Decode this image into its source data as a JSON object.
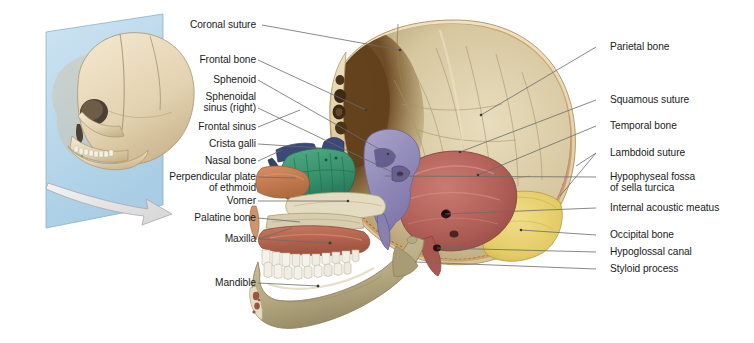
{
  "figure": {
    "background": "#ffffff"
  },
  "inset": {
    "name": "orientation-inset",
    "description": "Three-dimensional skull with sagittal cutting plane",
    "plane_color": "#bfdced",
    "bone_color": "#e8d9bd",
    "arrow_color": "#e2e2e2"
  },
  "labels_left": [
    {
      "id": "coronal-suture",
      "text": "Coronal suture",
      "text2": "",
      "x": 175,
      "y": 20,
      "lx": 262,
      "ly": 25,
      "tx": 400,
      "ty": 50
    },
    {
      "id": "frontal-bone",
      "text": "Frontal bone",
      "text2": "",
      "x": 186,
      "y": 55,
      "lx": 258,
      "ly": 60,
      "tx": 366,
      "ty": 110
    },
    {
      "id": "sphenoid",
      "text": "Sphenoid",
      "text2": "",
      "x": 205,
      "y": 75,
      "lx": 258,
      "ly": 80,
      "tx": 388,
      "ty": 154
    },
    {
      "id": "sphenoidal-sinus-right",
      "text": "Sphenoidal",
      "text2": "sinus (right)",
      "x": 183,
      "y": 92,
      "lx": 258,
      "ly": 108,
      "tx": 392,
      "ty": 172
    },
    {
      "id": "frontal-sinus",
      "text": "Frontal sinus",
      "text2": "",
      "x": 184,
      "y": 122,
      "lx": 258,
      "ly": 127,
      "tx": 300,
      "ty": 110
    },
    {
      "id": "crista-galli",
      "text": "Crista galli",
      "text2": "",
      "x": 192,
      "y": 139,
      "lx": 258,
      "ly": 144,
      "tx": 321,
      "ty": 148
    },
    {
      "id": "nasal-bone",
      "text": "Nasal bone",
      "text2": "",
      "x": 191,
      "y": 156,
      "lx": 258,
      "ly": 161,
      "tx": 282,
      "ty": 150
    },
    {
      "id": "perpendicular-plate-ethmoid",
      "text": "Perpendicular plate",
      "text2": "of ethmoid",
      "x": 155,
      "y": 172,
      "lx": 258,
      "ly": 177,
      "tx": 296,
      "ty": 178
    },
    {
      "id": "vomer",
      "text": "Vomer",
      "text2": "",
      "x": 217,
      "y": 196,
      "lx": 258,
      "ly": 201,
      "tx": 348,
      "ty": 201
    },
    {
      "id": "palatine-bone",
      "text": "Palatine bone",
      "text2": "",
      "x": 186,
      "y": 213,
      "lx": 258,
      "ly": 218,
      "tx": 300,
      "ty": 222
    },
    {
      "id": "maxilla",
      "text": "Maxilla",
      "text2": "",
      "x": 215,
      "y": 234,
      "lx": 258,
      "ly": 239,
      "tx": 330,
      "ty": 243
    },
    {
      "id": "mandible",
      "text": "Mandible",
      "text2": "",
      "x": 204,
      "y": 278,
      "lx": 258,
      "ly": 283,
      "tx": 318,
      "ty": 286
    }
  ],
  "labels_right": [
    {
      "id": "parietal-bone",
      "text": "Parietal bone",
      "text2": "",
      "x": 610,
      "y": 42,
      "lx": 596,
      "ly": 47,
      "tx": 481,
      "ty": 115
    },
    {
      "id": "squamous-suture",
      "text": "Squamous suture",
      "text2": "",
      "x": 610,
      "y": 95,
      "lx": 596,
      "ly": 100,
      "tx": 460,
      "ty": 152
    },
    {
      "id": "temporal-bone",
      "text": "Temporal bone",
      "text2": "",
      "x": 610,
      "y": 121,
      "lx": 596,
      "ly": 126,
      "tx": 478,
      "ty": 175
    },
    {
      "id": "lambdoid-suture",
      "text": "Lambdoid suture",
      "text2": "",
      "x": 610,
      "y": 148,
      "lx": 596,
      "ly": 153,
      "tx": 576,
      "ty": 166
    },
    {
      "id": "hypophyseal-fossa",
      "text": "Hypophyseal fossa",
      "text2": "of sella turcica",
      "x": 610,
      "y": 172,
      "lx": 596,
      "ly": 177,
      "tx": 385,
      "ty": 176
    },
    {
      "id": "internal-acoustic-meatus",
      "text": "Internal acoustic meatus",
      "text2": "",
      "x": 610,
      "y": 203,
      "lx": 596,
      "ly": 208,
      "tx": 445,
      "ty": 214
    },
    {
      "id": "occipital-bone",
      "text": "Occipital bone",
      "text2": "",
      "x": 610,
      "y": 230,
      "lx": 596,
      "ly": 235,
      "tx": 521,
      "ty": 230
    },
    {
      "id": "hypoglossal-canal",
      "text": "Hypoglossal canal",
      "text2": "",
      "x": 610,
      "y": 247,
      "lx": 596,
      "ly": 252,
      "tx": 437,
      "ty": 248
    },
    {
      "id": "styloid-process",
      "text": "Styloid process",
      "text2": "",
      "x": 610,
      "y": 264,
      "lx": 596,
      "ly": 269,
      "tx": 415,
      "ty": 262
    }
  ],
  "colors": {
    "outer_bone": "#e4d4ae",
    "inner_vault": "#ddd2b0",
    "vault_shadow": "#6d4a23",
    "diploe": "#c9a063",
    "suture_red": "#c9897e",
    "ethmoid_green": "#3f9a74",
    "sphenoid_purple": "#9a94c2",
    "temporal_salmon": "#b8645e",
    "occipital_yellow": "#e6cf6d",
    "nasal_navy": "#3c4878",
    "perp_plate_orange": "#c97d4e",
    "maxilla_red": "#b9644c",
    "mandible_tan": "#b9ad86",
    "teeth_white": "#f2f1ec",
    "leader_line": "#6b6b6b",
    "text": "#1b1b1b"
  }
}
